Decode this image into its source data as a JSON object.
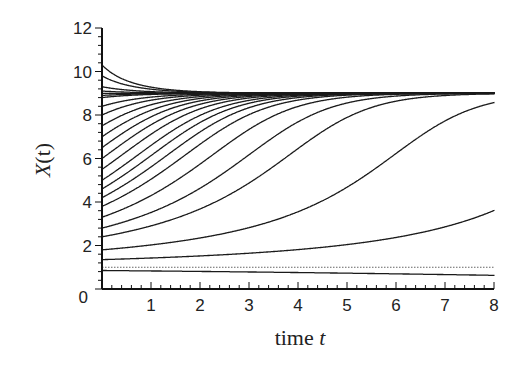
{
  "chart_data": {
    "type": "line",
    "title": "",
    "xlabel": "time t",
    "ylabel": "X(t)",
    "xlim": [
      0,
      8
    ],
    "ylim": [
      0,
      12
    ],
    "x_ticks": [
      "1",
      "2",
      "3",
      "4",
      "5",
      "6",
      "7",
      "8"
    ],
    "y_ticks": [
      "0",
      "2",
      "4",
      "6",
      "8",
      "10",
      "12"
    ],
    "grid": false,
    "legend": null,
    "model": {
      "description": "Logistic growth with Allee effect",
      "carrying_capacity": 9,
      "allee_threshold": 1,
      "rate": 0.165
    },
    "equilibrium_line": {
      "y": 1.0,
      "style": "dotted"
    },
    "initial_values": [
      10.3,
      9.8,
      9.3,
      9.1,
      9.0,
      8.9,
      8.8,
      8.4,
      8.0,
      7.5,
      7.0,
      6.5,
      6.0,
      5.5,
      5.0,
      4.6,
      4.2,
      3.8,
      3.3,
      2.8,
      2.4,
      1.8,
      1.35,
      0.85
    ],
    "series_endpoints_t8": {
      "above_threshold": 9.0,
      "lowest_above_threshold": 8.75,
      "below_threshold_extinct_at_t": 1.85
    }
  },
  "axes": {
    "x_title_main": "time ",
    "x_title_var": "t",
    "y_title_main": "X",
    "y_title_var": "(t)"
  }
}
